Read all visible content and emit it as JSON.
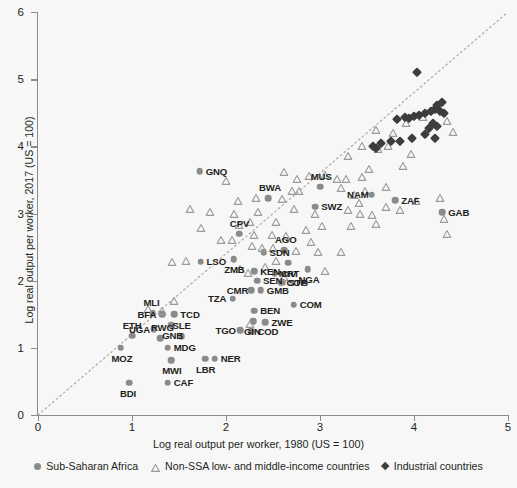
{
  "chart_data": {
    "type": "scatter",
    "title": "",
    "xlabel": "Log real output per worker, 1980 (US = 100)",
    "ylabel": "Log real output per worker, 2017 (US = 100)",
    "xlim": [
      0,
      5
    ],
    "ylim": [
      0,
      6
    ],
    "xticks": [
      0,
      1,
      2,
      3,
      4,
      5
    ],
    "yticks": [
      0,
      1,
      2,
      3,
      4,
      5,
      6
    ],
    "grid": false,
    "legend_position": "bottom",
    "annotations": [
      {
        "text": "45-degree reference line (dotted diagonal)",
        "from": [
          0,
          0
        ],
        "to": [
          5,
          5
        ]
      }
    ],
    "series": [
      {
        "name": "Sub-Saharan Africa",
        "marker": "circle",
        "color": "#8a8a8a",
        "points": [
          {
            "label": "GNQ",
            "x": 1.72,
            "y": 3.63
          },
          {
            "label": "CPV",
            "x": 2.14,
            "y": 2.7
          },
          {
            "label": "ZMB",
            "x": 2.08,
            "y": 2.32
          },
          {
            "label": "LSO",
            "x": 1.73,
            "y": 2.28
          },
          {
            "label": "KEN",
            "x": 2.3,
            "y": 2.14
          },
          {
            "label": "SEN",
            "x": 2.33,
            "y": 2.0
          },
          {
            "label": "GMB",
            "x": 2.37,
            "y": 1.86
          },
          {
            "label": "CMR",
            "x": 2.27,
            "y": 1.86
          },
          {
            "label": "TZA",
            "x": 2.07,
            "y": 1.73
          },
          {
            "label": "CIV",
            "x": 2.52,
            "y": 2.11
          },
          {
            "label": "COG",
            "x": 2.58,
            "y": 1.97
          },
          {
            "label": "STP",
            "x": 2.6,
            "y": 1.98
          },
          {
            "label": "SDN",
            "x": 2.4,
            "y": 2.42
          },
          {
            "label": "MRT",
            "x": 2.66,
            "y": 2.27
          },
          {
            "label": "AGO",
            "x": 2.62,
            "y": 2.45
          },
          {
            "label": "SWZ",
            "x": 2.95,
            "y": 3.1
          },
          {
            "label": "BWA",
            "x": 2.45,
            "y": 3.23
          },
          {
            "label": "MUS",
            "x": 3.0,
            "y": 3.4
          },
          {
            "label": "NAM",
            "x": 3.55,
            "y": 3.28
          },
          {
            "label": "ZAF",
            "x": 3.8,
            "y": 3.2
          },
          {
            "label": "GAB",
            "x": 4.3,
            "y": 3.02
          },
          {
            "label": "NGA",
            "x": 2.87,
            "y": 2.17
          },
          {
            "label": "COM",
            "x": 2.72,
            "y": 1.64
          },
          {
            "label": "ZWE",
            "x": 2.42,
            "y": 1.38
          },
          {
            "label": "BEN",
            "x": 2.3,
            "y": 1.55
          },
          {
            "label": "GIN",
            "x": 2.29,
            "y": 1.4
          },
          {
            "label": "TGO",
            "x": 2.15,
            "y": 1.26
          },
          {
            "label": "COD",
            "x": 2.27,
            "y": 1.25
          },
          {
            "label": "MLI",
            "x": 1.22,
            "y": 1.52
          },
          {
            "label": "BFA",
            "x": 1.32,
            "y": 1.5
          },
          {
            "label": "TCD",
            "x": 1.45,
            "y": 1.5
          },
          {
            "label": "GNB",
            "x": 1.42,
            "y": 1.34
          },
          {
            "label": "UGA",
            "x": 1.23,
            "y": 1.28
          },
          {
            "label": "ETH",
            "x": 1.0,
            "y": 1.18
          },
          {
            "label": "RWG",
            "x": 1.3,
            "y": 1.14
          },
          {
            "label": "SLE",
            "x": 1.53,
            "y": 1.17
          },
          {
            "label": "MDG",
            "x": 1.38,
            "y": 1.0
          },
          {
            "label": "MOZ",
            "x": 0.88,
            "y": 1.0
          },
          {
            "label": "MWI",
            "x": 1.42,
            "y": 0.82
          },
          {
            "label": "LBR",
            "x": 1.78,
            "y": 0.84
          },
          {
            "label": "NER",
            "x": 1.88,
            "y": 0.84
          },
          {
            "label": "CAF",
            "x": 1.38,
            "y": 0.48
          },
          {
            "label": "BDI",
            "x": 0.97,
            "y": 0.48
          }
        ]
      },
      {
        "name": "Non-SSA low- and middle-income countries",
        "marker": "triangle",
        "color": "#9a9a9a",
        "points": [
          {
            "x": 2.0,
            "y": 3.48
          },
          {
            "x": 2.13,
            "y": 3.18
          },
          {
            "x": 1.83,
            "y": 3.02
          },
          {
            "x": 1.73,
            "y": 2.78
          },
          {
            "x": 1.95,
            "y": 2.6
          },
          {
            "x": 2.06,
            "y": 2.6
          },
          {
            "x": 1.57,
            "y": 2.3
          },
          {
            "x": 1.43,
            "y": 2.28
          },
          {
            "x": 2.23,
            "y": 2.12
          },
          {
            "x": 2.34,
            "y": 3.02
          },
          {
            "x": 2.25,
            "y": 2.88
          },
          {
            "x": 2.62,
            "y": 3.62
          },
          {
            "x": 2.76,
            "y": 3.52
          },
          {
            "x": 2.88,
            "y": 3.56
          },
          {
            "x": 2.7,
            "y": 3.33
          },
          {
            "x": 2.78,
            "y": 3.34
          },
          {
            "x": 2.32,
            "y": 3.23
          },
          {
            "x": 2.6,
            "y": 3.21
          },
          {
            "x": 2.09,
            "y": 3.0
          },
          {
            "x": 2.14,
            "y": 2.83
          },
          {
            "x": 2.72,
            "y": 3.07
          },
          {
            "x": 2.53,
            "y": 2.88
          },
          {
            "x": 2.49,
            "y": 2.68
          },
          {
            "x": 2.64,
            "y": 2.66
          },
          {
            "x": 2.3,
            "y": 2.68
          },
          {
            "x": 2.38,
            "y": 2.49
          },
          {
            "x": 2.74,
            "y": 2.44
          },
          {
            "x": 2.53,
            "y": 2.3
          },
          {
            "x": 2.98,
            "y": 2.42
          },
          {
            "x": 3.22,
            "y": 2.43
          },
          {
            "x": 3.05,
            "y": 2.15
          },
          {
            "x": 3.3,
            "y": 3.05
          },
          {
            "x": 3.42,
            "y": 3.16
          },
          {
            "x": 3.22,
            "y": 3.38
          },
          {
            "x": 3.05,
            "y": 3.57
          },
          {
            "x": 3.18,
            "y": 3.52
          },
          {
            "x": 3.28,
            "y": 3.52
          },
          {
            "x": 3.45,
            "y": 3.55
          },
          {
            "x": 3.52,
            "y": 3.66
          },
          {
            "x": 3.62,
            "y": 3.96
          },
          {
            "x": 3.72,
            "y": 4.0
          },
          {
            "x": 3.92,
            "y": 4.35
          },
          {
            "x": 4.1,
            "y": 4.43
          },
          {
            "x": 4.25,
            "y": 4.6
          },
          {
            "x": 4.35,
            "y": 4.37
          },
          {
            "x": 4.42,
            "y": 4.22
          },
          {
            "x": 4.02,
            "y": 3.18
          },
          {
            "x": 4.28,
            "y": 3.23
          },
          {
            "x": 4.32,
            "y": 2.92
          },
          {
            "x": 4.35,
            "y": 2.7
          },
          {
            "x": 3.85,
            "y": 3.05
          },
          {
            "x": 3.7,
            "y": 3.1
          },
          {
            "x": 3.55,
            "y": 2.98
          },
          {
            "x": 3.43,
            "y": 3.0
          },
          {
            "x": 3.6,
            "y": 2.84
          },
          {
            "x": 3.33,
            "y": 2.82
          },
          {
            "x": 3.02,
            "y": 2.82
          },
          {
            "x": 2.95,
            "y": 3.0
          },
          {
            "x": 2.85,
            "y": 2.76
          },
          {
            "x": 1.62,
            "y": 3.07
          },
          {
            "x": 1.45,
            "y": 1.7
          },
          {
            "x": 1.32,
            "y": 1.55
          },
          {
            "x": 1.17,
            "y": 1.58
          },
          {
            "x": 2.25,
            "y": 1.36
          },
          {
            "x": 2.5,
            "y": 2.48
          },
          {
            "x": 2.28,
            "y": 2.52
          },
          {
            "x": 2.42,
            "y": 2.2
          },
          {
            "x": 2.15,
            "y": 2.18
          },
          {
            "x": 3.7,
            "y": 3.4
          },
          {
            "x": 3.88,
            "y": 3.7
          },
          {
            "x": 3.97,
            "y": 3.88
          },
          {
            "x": 3.48,
            "y": 3.34
          },
          {
            "x": 3.36,
            "y": 3.27
          },
          {
            "x": 3.6,
            "y": 4.25
          },
          {
            "x": 3.78,
            "y": 4.2
          },
          {
            "x": 3.45,
            "y": 4.0
          },
          {
            "x": 3.3,
            "y": 3.85
          },
          {
            "x": 2.9,
            "y": 2.58
          },
          {
            "x": 2.62,
            "y": 2.06
          }
        ]
      },
      {
        "name": "Industrial countries",
        "marker": "diamond",
        "color": "#3d3d3d",
        "points": [
          {
            "x": 4.03,
            "y": 5.1
          },
          {
            "x": 3.9,
            "y": 4.44
          },
          {
            "x": 3.95,
            "y": 4.42
          },
          {
            "x": 4.0,
            "y": 4.45
          },
          {
            "x": 4.05,
            "y": 4.47
          },
          {
            "x": 4.12,
            "y": 4.5
          },
          {
            "x": 4.18,
            "y": 4.52
          },
          {
            "x": 4.22,
            "y": 4.55
          },
          {
            "x": 4.28,
            "y": 4.53
          },
          {
            "x": 4.32,
            "y": 4.5
          },
          {
            "x": 4.24,
            "y": 4.62
          },
          {
            "x": 4.3,
            "y": 4.66
          },
          {
            "x": 4.2,
            "y": 4.35
          },
          {
            "x": 4.24,
            "y": 4.3
          },
          {
            "x": 4.16,
            "y": 4.27
          },
          {
            "x": 4.12,
            "y": 4.18
          },
          {
            "x": 4.22,
            "y": 4.12
          },
          {
            "x": 3.82,
            "y": 4.4
          },
          {
            "x": 3.75,
            "y": 4.08
          },
          {
            "x": 3.85,
            "y": 4.08
          },
          {
            "x": 3.56,
            "y": 4.0
          },
          {
            "x": 3.6,
            "y": 3.98
          },
          {
            "x": 3.65,
            "y": 4.05
          },
          {
            "x": 3.98,
            "y": 4.12
          }
        ]
      }
    ]
  },
  "legend": {
    "items": [
      {
        "label": "Sub-Saharan Africa",
        "marker": "circle-icon"
      },
      {
        "label": "Non-SSA low- and middle-income countries",
        "marker": "triangle-icon"
      },
      {
        "label": "Industrial countries",
        "marker": "diamond-icon"
      }
    ]
  },
  "colors": {
    "background": "#f7f7f7",
    "ssa": "#8a8a8a",
    "nonssa": "#9a9a9a",
    "industrial": "#3d3d3d",
    "axis": "#8c8c8c",
    "refline": "#b0a8a0",
    "text": "#231f20"
  }
}
